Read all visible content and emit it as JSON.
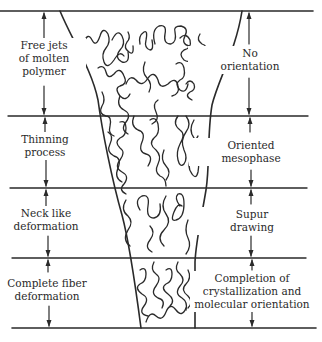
{
  "diagram": {
    "stroke_color": "#2a2a2a",
    "background": "#ffffff",
    "left_labels": [
      {
        "text": "Free jets\nof molten\npolymer"
      },
      {
        "text": "Thinning\nprocess"
      },
      {
        "text": "Neck like\ndeformation"
      },
      {
        "text": "Complete fiber\ndeformation"
      }
    ],
    "right_labels": [
      {
        "text": "No\norientation"
      },
      {
        "text": "Oriented\nmesophase"
      },
      {
        "text": "Supur\ndrawing"
      },
      {
        "text": "Completion of\ncrystallization and\nmolecular orientation"
      }
    ],
    "boundaries_y": [
      11,
      116,
      188,
      258,
      328
    ]
  }
}
